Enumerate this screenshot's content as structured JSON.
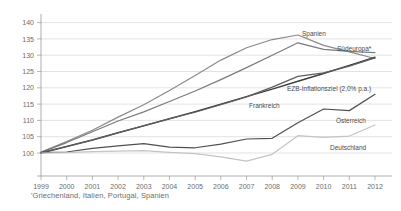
{
  "chart_data": {
    "type": "line",
    "title": "",
    "subtitle": "",
    "xlabel": "",
    "ylabel": "",
    "x": [
      1999,
      2000,
      2001,
      2002,
      2003,
      2004,
      2005,
      2006,
      2007,
      2008,
      2009,
      2010,
      2011,
      2012
    ],
    "xticklabels": [
      "1999",
      "2000",
      "2001",
      "2002",
      "2003",
      "2004",
      "2005",
      "2006",
      "2007",
      "2008",
      "2009",
      "2010",
      "2011",
      "2012"
    ],
    "yticks": [
      100,
      105,
      110,
      115,
      120,
      125,
      130,
      135,
      140
    ],
    "yticklabels": [
      "100",
      "105",
      "110",
      "115",
      "120",
      "125",
      "130",
      "135",
      "140"
    ],
    "ylim": [
      96,
      142
    ],
    "xlim": [
      1999,
      2012
    ],
    "grid": true,
    "legend_position": "inline-right",
    "footnote": "'Griechenland, Italien, Portugal, Spanien",
    "series": [
      {
        "name": "Spanien",
        "label": "Spanien",
        "color": "#8a8a8a",
        "width": 1.2,
        "values": [
          100.3,
          103.5,
          107.0,
          111.0,
          114.8,
          119.2,
          123.8,
          128.5,
          132.3,
          134.8,
          136.2,
          133.0,
          131.0,
          129.0
        ]
      },
      {
        "name": "Suedeuropa",
        "label": "Südeuropa*",
        "color": "#7a7a7a",
        "width": 1.2,
        "values": [
          100.2,
          103.2,
          106.5,
          109.8,
          112.6,
          115.8,
          119.0,
          122.5,
          126.2,
          130.0,
          133.8,
          131.8,
          131.2,
          130.8
        ]
      },
      {
        "name": "EZB-Inflationsziel",
        "label": "EZB-Inflationsziel (2,0% p.a.)",
        "color": "#3d3d3d",
        "width": 1.4,
        "values": [
          100.0,
          102.0,
          104.0,
          106.2,
          108.3,
          110.5,
          112.7,
          115.0,
          117.3,
          119.6,
          122.0,
          124.4,
          126.9,
          129.4
        ]
      },
      {
        "name": "Frankreich",
        "label": "Frankreich",
        "color": "#5e5e5e",
        "width": 1.2,
        "values": [
          100.1,
          102.0,
          104.0,
          106.2,
          108.4,
          110.5,
          112.5,
          114.8,
          117.2,
          120.2,
          123.5,
          124.6,
          126.6,
          129.2
        ]
      },
      {
        "name": "Oesterreich",
        "label": "Österreich",
        "color": "#4f4f4f",
        "width": 1.2,
        "values": [
          100.1,
          100.3,
          101.4,
          102.2,
          102.9,
          101.8,
          101.6,
          102.7,
          104.3,
          104.5,
          109.3,
          113.5,
          113.0,
          118.0
        ]
      },
      {
        "name": "Deutschland",
        "label": "Deutschland",
        "color": "#c4c4c4",
        "width": 1.2,
        "values": [
          100.0,
          100.1,
          100.4,
          100.6,
          100.7,
          100.2,
          99.8,
          98.8,
          97.5,
          99.6,
          105.3,
          104.8,
          105.2,
          108.6
        ]
      }
    ],
    "annotations": [
      {
        "name": "Spanien",
        "text": "Spanien",
        "x": 302,
        "y": 36
      },
      {
        "name": "Suedeuropa",
        "text": "Südeuropa*",
        "x": 337,
        "y": 51
      },
      {
        "name": "EZB-Inflationsziel",
        "text": "EZB-Inflationsziel (2,0% p.a.)",
        "x": 287,
        "y": 91
      },
      {
        "name": "Frankreich",
        "text": "Frankreich",
        "x": 249,
        "y": 108
      },
      {
        "name": "Oesterreich",
        "text": "Österreich",
        "x": 336,
        "y": 123
      },
      {
        "name": "Deutschland",
        "text": "Deutschland",
        "x": 330,
        "y": 150
      }
    ]
  }
}
